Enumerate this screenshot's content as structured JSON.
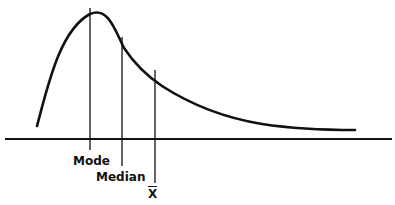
{
  "diagram": {
    "labels": {
      "mode": "Mode",
      "median": "Median",
      "mean": "X̅"
    },
    "colors": {
      "ink": "#111111",
      "background": "#ffffff"
    }
  }
}
